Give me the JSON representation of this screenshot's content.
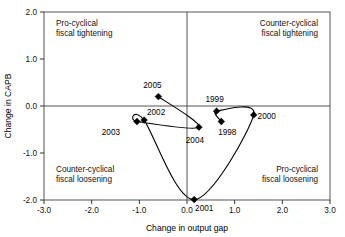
{
  "chart_data": {
    "type": "scatter",
    "title": "",
    "xlabel": "Change in output gap",
    "ylabel": "Change in CAPB",
    "xlim": [
      -3.0,
      3.0
    ],
    "ylim": [
      -2.0,
      2.0
    ],
    "xticks": [
      "-3.0",
      "-2.0",
      "-1.0",
      "0.0",
      "1.0",
      "2.0",
      "3.0"
    ],
    "xtick_values": [
      -3.0,
      -2.0,
      -1.0,
      0.0,
      1.0,
      2.0,
      3.0
    ],
    "yticks": [
      "2.0",
      "1.0",
      "0.0",
      "-1.0",
      "-2.0"
    ],
    "ytick_values": [
      2.0,
      1.0,
      0.0,
      -1.0,
      -2.0
    ],
    "grid": false,
    "legend": "none",
    "connected": true,
    "series": [
      {
        "name": "fiscal stance path",
        "points": [
          {
            "label": "1998",
            "x": 0.72,
            "y": -0.33,
            "label_dx": 6,
            "label_dy": 13
          },
          {
            "label": "1999",
            "x": 0.62,
            "y": -0.11,
            "label_dx": -2,
            "label_dy": -9
          },
          {
            "label": "2000",
            "x": 1.4,
            "y": -0.19,
            "label_dx": 13,
            "label_dy": 4
          },
          {
            "label": "2001",
            "x": 0.15,
            "y": -1.99,
            "label_dx": 10,
            "label_dy": 11
          },
          {
            "label": "2002",
            "x": -0.9,
            "y": -0.3,
            "label_dx": 12,
            "label_dy": -5
          },
          {
            "label": "2003",
            "x": -1.05,
            "y": -0.33,
            "label_dx": -26,
            "label_dy": 13
          },
          {
            "label": "2004",
            "x": 0.25,
            "y": -0.45,
            "label_dx": -4,
            "label_dy": 16
          },
          {
            "label": "2005",
            "x": -0.6,
            "y": 0.2,
            "label_dx": -6,
            "label_dy": -9
          }
        ]
      }
    ],
    "quadrants": [
      {
        "key": "top-left",
        "line1": "Pro-cyclical",
        "line2": "fiscal tightening"
      },
      {
        "key": "top-right",
        "line1": "Counter-cyclical",
        "line2": "fiscal tightening"
      },
      {
        "key": "bottom-left",
        "line1": "Counter-cyclical",
        "line2": "fiscal loosening"
      },
      {
        "key": "bottom-right",
        "line1": "Pro-cyclical",
        "line2": "fiscal loosening"
      }
    ],
    "colors": {
      "marker": "#000000",
      "line": "#000000",
      "axis": "#555555",
      "text": "#000000",
      "background": "#ffffff"
    }
  }
}
